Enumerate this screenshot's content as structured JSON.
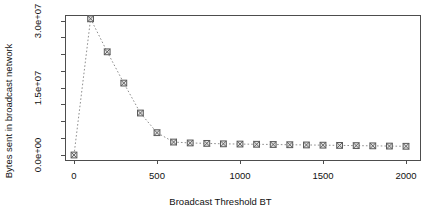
{
  "chart_data": {
    "type": "line",
    "title": "",
    "xlabel": "Broadcast Threshold BT",
    "ylabel": "Bytes sent in broadcast network",
    "x": [
      0,
      100,
      200,
      300,
      400,
      500,
      600,
      700,
      800,
      900,
      1000,
      1100,
      1200,
      1300,
      1400,
      1500,
      1600,
      1700,
      1800,
      1900,
      2000
    ],
    "values": [
      0,
      30500000,
      23100000,
      16100000,
      9400000,
      5000000,
      2900000,
      2700000,
      2600000,
      2500000,
      2450000,
      2400000,
      2350000,
      2300000,
      2250000,
      2200000,
      2150000,
      2100000,
      2050000,
      2000000,
      1950000
    ],
    "xlim": [
      -40,
      2080
    ],
    "ylim": [
      -1200000,
      31500000
    ],
    "xticks": [
      0,
      500,
      1000,
      1500,
      2000
    ],
    "xtick_labels": [
      "0",
      "500",
      "1000",
      "1500",
      "2000"
    ],
    "yticks": [
      0,
      7500000,
      15000000,
      22500000,
      30000000
    ],
    "ytick_labels": [
      "0.0e+00",
      "",
      "1.5e+07",
      "",
      "3.0e+07"
    ],
    "ytick_minor": [
      3750000,
      11250000,
      18750000,
      26250000
    ],
    "grid": false,
    "legend": null,
    "marker": "square-with-x",
    "line_style": "dotted",
    "line_color": "#8f8f8f",
    "marker_fill": "#e2e2e2",
    "marker_stroke": "#5a5a5a",
    "axis_color": "#4d4d4d",
    "background": "#ffffff"
  }
}
